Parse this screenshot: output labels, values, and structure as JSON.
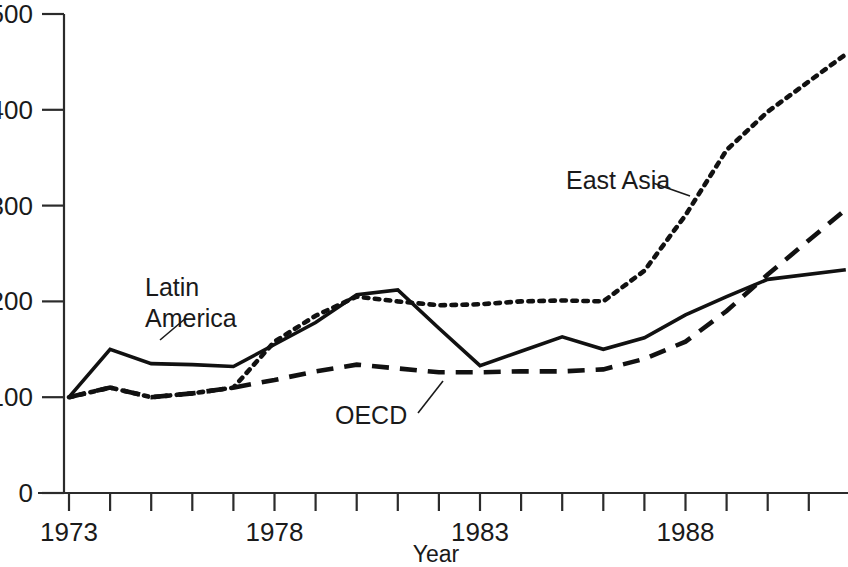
{
  "chart_data": {
    "type": "line",
    "title": "",
    "xlabel": "Year",
    "ylabel": "",
    "xlim": [
      1973,
      1991.9
    ],
    "ylim": [
      0,
      500
    ],
    "grid": false,
    "legend_position": "inline-annotations",
    "y_ticks": [
      0,
      100,
      200,
      300,
      400,
      500
    ],
    "y_tick_labels": [
      "0",
      "100",
      "200",
      "300",
      "400",
      "500"
    ],
    "x_ticks": [
      1973,
      1974,
      1975,
      1976,
      1977,
      1978,
      1979,
      1980,
      1981,
      1982,
      1983,
      1984,
      1985,
      1986,
      1987,
      1988,
      1989,
      1990,
      1991,
      1992
    ],
    "x_tick_labels_shown": [
      "1973",
      "1978",
      "1983",
      "1988"
    ],
    "x_labeled_ticks": [
      1973,
      1978,
      1983,
      1988
    ],
    "x": [
      1973,
      1974,
      1975,
      1976,
      1977,
      1978,
      1979,
      1980,
      1981,
      1982,
      1983,
      1984,
      1985,
      1986,
      1987,
      1988,
      1989,
      1990,
      1991.9
    ],
    "series": [
      {
        "name": "Latin America",
        "style": "solid",
        "color": "#111111",
        "values": [
          100,
          150,
          135,
          134,
          132,
          155,
          178,
          207,
          212,
          172,
          133,
          148,
          163,
          150,
          162,
          186,
          205,
          223,
          233
        ]
      },
      {
        "name": "East Asia",
        "style": "dotted",
        "color": "#111111",
        "values": [
          100,
          110,
          100,
          104,
          110,
          158,
          185,
          205,
          200,
          196,
          197,
          200,
          201,
          200,
          232,
          290,
          358,
          398,
          458
        ]
      },
      {
        "name": "OECD",
        "style": "dashed",
        "color": "#111111",
        "values": [
          100,
          110,
          100,
          104,
          110,
          118,
          127,
          134,
          130,
          126,
          126,
          127,
          127,
          129,
          140,
          158,
          190,
          228,
          296
        ]
      }
    ],
    "annotations": [
      {
        "text": "Latin America",
        "lines": [
          "Latin",
          "America"
        ],
        "label_x": 145,
        "label_y": 296,
        "leader_from_x": 160,
        "leader_from_y": 340,
        "leader_to_x": 186,
        "leader_to_y": 318
      },
      {
        "text": "East Asia",
        "lines": [
          "East Asia"
        ],
        "label_x": 566,
        "label_y": 189,
        "leader_from_x": 653,
        "leader_from_y": 183,
        "leader_to_x": 690,
        "leader_to_y": 196
      },
      {
        "text": "OECD",
        "lines": [
          "OECD"
        ],
        "label_x": 335,
        "label_y": 424,
        "leader_from_x": 418,
        "leader_from_y": 413,
        "leader_to_x": 443,
        "leader_to_y": 381
      }
    ]
  },
  "axis": {
    "x_title": "Year"
  }
}
